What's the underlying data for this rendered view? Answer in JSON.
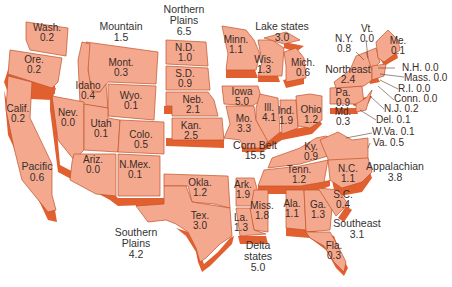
{
  "colors": {
    "face": "#f4a98e",
    "extrusion": "#e2602f",
    "border": "#c0502a",
    "text": "#3a2a26"
  },
  "regions": [
    {
      "name": "Mountain",
      "value": "1.5"
    },
    {
      "name": "Northern Plains",
      "line1": "Northern",
      "line2": "Plains",
      "value": "6.5"
    },
    {
      "name": "Lake states",
      "value": "3.0"
    },
    {
      "name": "Northeast",
      "value": "2.4"
    },
    {
      "name": "Pacific",
      "value": "0.6"
    },
    {
      "name": "Corn Belt",
      "value": "15.5"
    },
    {
      "name": "Appalachian",
      "value": "3.8"
    },
    {
      "name": "Southern Plains",
      "line1": "Southern",
      "line2": "Plains",
      "value": "4.2"
    },
    {
      "name": "Delta states",
      "line1": "Delta",
      "line2": "states",
      "value": "5.0"
    },
    {
      "name": "Southeast",
      "value": "3.1"
    }
  ],
  "states": {
    "wash": {
      "abbr": "Wash.",
      "value": "0.2"
    },
    "ore": {
      "abbr": "Ore.",
      "value": "0.2"
    },
    "calif": {
      "abbr": "Calif.",
      "value": "0.2"
    },
    "mont": {
      "abbr": "Mont.",
      "value": "0.3"
    },
    "idaho": {
      "abbr": "Idaho",
      "value": "0.4"
    },
    "wyo": {
      "abbr": "Wyo.",
      "value": "0.1"
    },
    "nev": {
      "abbr": "Nev.",
      "value": "0.0"
    },
    "utah": {
      "abbr": "Utah",
      "value": "0.1"
    },
    "colo": {
      "abbr": "Colo.",
      "value": "0.5"
    },
    "ariz": {
      "abbr": "Ariz.",
      "value": "0.0"
    },
    "nmex": {
      "abbr": "N.Mex.",
      "value": "0.1"
    },
    "nd": {
      "abbr": "N.D.",
      "value": "1.0"
    },
    "sd": {
      "abbr": "S.D.",
      "value": "0.9"
    },
    "neb": {
      "abbr": "Neb.",
      "value": "2.1"
    },
    "kan": {
      "abbr": "Kan.",
      "value": "2.5"
    },
    "minn": {
      "abbr": "Minn.",
      "value": "1.1"
    },
    "wis": {
      "abbr": "Wis.",
      "value": "1.3"
    },
    "mich": {
      "abbr": "Mich.",
      "value": "0.6"
    },
    "iowa": {
      "abbr": "Iowa",
      "value": "5.0"
    },
    "mo": {
      "abbr": "Mo.",
      "value": "3.3"
    },
    "ill": {
      "abbr": "Ill.",
      "value": "4.1"
    },
    "ind": {
      "abbr": "Ind.",
      "value": "1.9"
    },
    "ohio": {
      "abbr": "Ohio",
      "value": "1.2"
    },
    "okla": {
      "abbr": "Okla.",
      "value": "1.2"
    },
    "tex": {
      "abbr": "Tex.",
      "value": "3.0"
    },
    "ark": {
      "abbr": "Ark.",
      "value": "1.9"
    },
    "miss": {
      "abbr": "Miss.",
      "value": "1.8"
    },
    "la": {
      "abbr": "La.",
      "value": "1.3"
    },
    "ky": {
      "abbr": "Ky.",
      "value": "0.9"
    },
    "tenn": {
      "abbr": "Tenn.",
      "value": "1.2"
    },
    "nc": {
      "abbr": "N.C.",
      "value": "1.1"
    },
    "ala": {
      "abbr": "Ala.",
      "value": "1.1"
    },
    "ga": {
      "abbr": "Ga.",
      "value": "1.3"
    },
    "sc": {
      "abbr": "S.C.",
      "value": "0.4"
    },
    "fla": {
      "abbr": "Fla.",
      "value": "0.3"
    },
    "ny": {
      "abbr": "N.Y.",
      "value": "0.8"
    },
    "vt": {
      "abbr": "Vt.",
      "value": "0.0"
    },
    "me": {
      "abbr": "Me.",
      "value": "0.1"
    },
    "pa": {
      "abbr": "Pa.",
      "value": "0.9"
    },
    "md": {
      "abbr": "Md.",
      "value": "0.3"
    },
    "nh": {
      "abbr": "N.H.",
      "value": "0.0"
    },
    "mass": {
      "abbr": "Mass.",
      "value": "0.0"
    },
    "ri": {
      "abbr": "R.I.",
      "value": "0.0"
    },
    "conn": {
      "abbr": "Conn.",
      "value": "0.0"
    },
    "nj": {
      "abbr": "N.J.",
      "value": "0.2"
    },
    "del": {
      "abbr": "Del.",
      "value": "0.1"
    },
    "wva": {
      "abbr": "W.Va.",
      "value": "0.1"
    },
    "va": {
      "abbr": "Va.",
      "value": "0.5"
    }
  }
}
